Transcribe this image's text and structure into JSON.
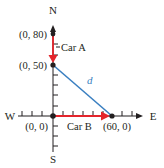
{
  "diagram": {
    "compass": {
      "north": "N",
      "south": "S",
      "east": "E",
      "west": "W"
    },
    "points": [
      {
        "id": "p80",
        "label": "(0, 80)"
      },
      {
        "id": "p50",
        "label": "(0, 50)"
      },
      {
        "id": "origin",
        "label": "(0, 0)"
      },
      {
        "id": "p60",
        "label": "(60, 0)"
      }
    ],
    "vectors": [
      {
        "label": "Car A",
        "from": "(0, 80)",
        "to": "(0, 50)"
      },
      {
        "label": "Car B",
        "from": "(0, 0)",
        "to": "(60, 0)"
      }
    ],
    "distance_label": "d",
    "colors": {
      "axis": "#231f20",
      "car_arrow": "#e4252c",
      "distance_line": "#3a7fc1"
    }
  }
}
